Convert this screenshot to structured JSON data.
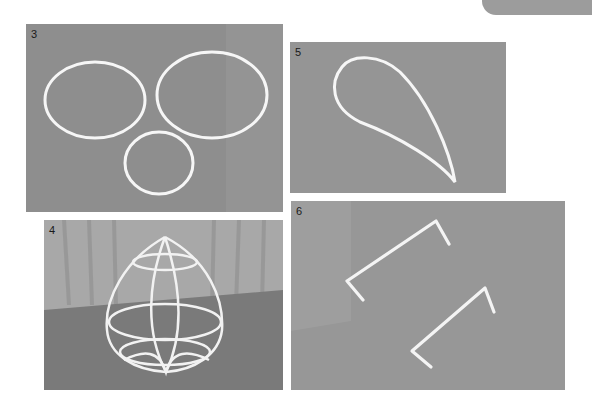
{
  "page": {
    "corner_tab_color": "#9c9c9c",
    "wire_color": "#f4f4f4"
  },
  "panels": [
    {
      "id": "p3",
      "number": "3",
      "subject": "three wire rings (two ovals and one circle)"
    },
    {
      "id": "p5",
      "number": "5",
      "subject": "teardrop-shaped wire loop"
    },
    {
      "id": "p4",
      "number": "4",
      "subject": "assembled wire dome frame"
    },
    {
      "id": "p6",
      "number": "6",
      "subject": "two bent wire staples"
    }
  ]
}
